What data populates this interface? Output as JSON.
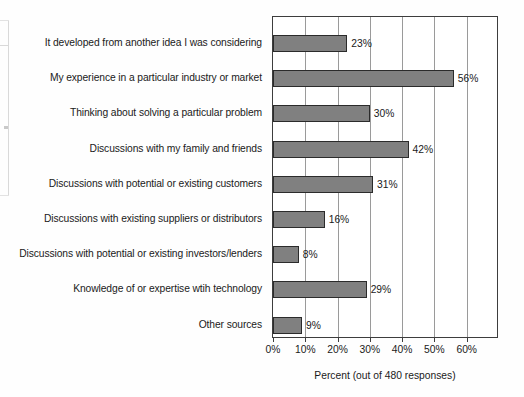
{
  "chart_data": {
    "type": "bar",
    "orientation": "horizontal",
    "title": "",
    "xlabel": "Percent (out of 480 responses)",
    "ylabel": "",
    "xlim": [
      0,
      70
    ],
    "xticks": [
      0,
      10,
      20,
      30,
      40,
      50,
      60
    ],
    "xtick_labels": [
      "0%",
      "10%",
      "20%",
      "30%",
      "40%",
      "50%",
      "60%"
    ],
    "grid": "vertical",
    "legend": "none",
    "bar_color": "#808080",
    "bar_edge_color": "#2b2b2b",
    "categories": [
      "It developed from another idea I was considering",
      "My experience in a particular industry or market",
      "Thinking about solving a particular problem",
      "Discussions with my family and friends",
      "Discussions with potential or existing customers",
      "Discussions with existing suppliers or distributors",
      "Discussions with potential or existing investors/lenders",
      "Knowledge of or expertise wtih technology",
      "Other sources"
    ],
    "values": [
      23,
      56,
      30,
      42,
      31,
      16,
      8,
      29,
      9
    ],
    "value_labels": [
      "23%",
      "56%",
      "30%",
      "42%",
      "31%",
      "16%",
      "8%",
      "29%",
      "9%"
    ]
  }
}
